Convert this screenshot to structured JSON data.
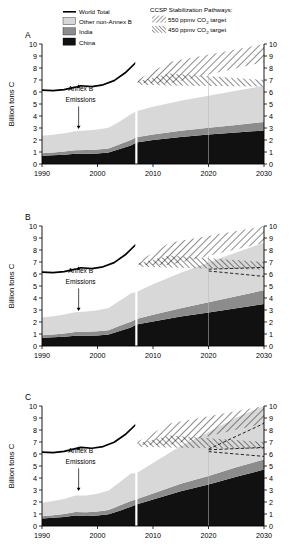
{
  "figure": {
    "width": 294,
    "height": 549,
    "background": "#ffffff"
  },
  "legend_series": {
    "title": "",
    "items": [
      {
        "label": "World Total",
        "swatch": "line",
        "color": "#000000",
        "name": "world-total"
      },
      {
        "label": "Other non-Annex B",
        "swatch": "fill",
        "color": "#d8d8d8",
        "name": "other-non-annex-b"
      },
      {
        "label": "India",
        "swatch": "fill",
        "color": "#8c8c8c",
        "name": "india"
      },
      {
        "label": "China",
        "swatch": "fill",
        "color": "#111111",
        "name": "china"
      }
    ]
  },
  "legend_pathways": {
    "title": "CCSP Stabilization Pathways:",
    "items": [
      {
        "label_pre": "550 ppmv CO",
        "label_sub": "2",
        "label_post": " target",
        "hatch": "forward",
        "name": "target-550"
      },
      {
        "label_pre": "450 ppmv CO",
        "label_sub": "2",
        "label_post": " target",
        "hatch": "backward",
        "name": "target-450"
      }
    ]
  },
  "annotation": {
    "line1": "Annex B",
    "line2": "Emissions"
  },
  "axis": {
    "ylabel": "Billion tons C",
    "yticks": [
      0,
      1,
      2,
      3,
      4,
      5,
      6,
      7,
      8,
      9,
      10
    ],
    "ylim": [
      0,
      10
    ],
    "xticks": [
      1990,
      2000,
      2010,
      2020,
      2030
    ],
    "xlim": [
      1990,
      2030
    ],
    "divider_year": 2007
  },
  "chart_data": {
    "type": "area",
    "title": "",
    "xlabel": "",
    "ylabel": "Billion tons C",
    "xlim": [
      1990,
      2030
    ],
    "ylim": [
      0,
      10
    ],
    "grid": false,
    "legend_position": "top",
    "panels": [
      {
        "label": "A",
        "x": [
          1990,
          1992,
          1994,
          1996,
          1998,
          2000,
          2002,
          2004,
          2006,
          2007,
          2010,
          2015,
          2020,
          2025,
          2030
        ],
        "series": [
          {
            "name": "China",
            "color": "#111111",
            "values": [
              0.68,
              0.72,
              0.78,
              0.86,
              0.86,
              0.88,
              0.95,
              1.25,
              1.55,
              1.8,
              2.0,
              2.25,
              2.45,
              2.62,
              2.8
            ]
          },
          {
            "name": "India",
            "color": "#8c8c8c",
            "values": [
              0.22,
              0.24,
              0.26,
              0.29,
              0.31,
              0.33,
              0.35,
              0.4,
              0.45,
              0.42,
              0.46,
              0.52,
              0.58,
              0.64,
              0.7
            ]
          },
          {
            "name": "Other non-Annex B",
            "color": "#d8d8d8",
            "values": [
              1.45,
              1.48,
              1.52,
              1.58,
              1.62,
              1.66,
              1.72,
              1.9,
              2.15,
              2.18,
              2.32,
              2.5,
              2.65,
              2.85,
              3.02
            ]
          }
        ],
        "world_total": {
          "x": [
            1990,
            1992,
            1994,
            1996,
            1997,
            1999,
            2001,
            2003,
            2005,
            2007
          ],
          "y": [
            6.15,
            6.12,
            6.2,
            6.4,
            6.52,
            6.45,
            6.6,
            6.95,
            7.6,
            8.5
          ]
        },
        "dashed_lines": [],
        "wedge_550": {
          "x": [
            2007,
            2013,
            2030
          ],
          "upper": [
            6.95,
            8.5,
            10.0
          ],
          "lower": [
            6.75,
            6.7,
            8.5
          ]
        },
        "wedge_450": {
          "x": [
            2007,
            2013,
            2030
          ],
          "upper": [
            6.85,
            7.55,
            7.0
          ],
          "lower": [
            6.6,
            6.55,
            6.45
          ]
        }
      },
      {
        "label": "B",
        "x": [
          1990,
          1992,
          1994,
          1996,
          1998,
          2000,
          2002,
          2004,
          2006,
          2007,
          2010,
          2015,
          2020,
          2025,
          2030
        ],
        "series": [
          {
            "name": "China",
            "color": "#111111",
            "values": [
              0.68,
              0.72,
              0.78,
              0.86,
              0.86,
              0.88,
              0.95,
              1.25,
              1.55,
              1.8,
              2.05,
              2.45,
              2.8,
              3.15,
              3.5
            ]
          },
          {
            "name": "India",
            "color": "#8c8c8c",
            "values": [
              0.22,
              0.24,
              0.26,
              0.3,
              0.32,
              0.34,
              0.37,
              0.43,
              0.48,
              0.45,
              0.55,
              0.7,
              0.85,
              1.0,
              1.15
            ]
          },
          {
            "name": "Other non-Annex B",
            "color": "#d8d8d8",
            "values": [
              1.48,
              1.52,
              1.58,
              1.66,
              1.7,
              1.76,
              1.85,
              2.1,
              2.35,
              2.25,
              2.55,
              2.95,
              3.3,
              3.65,
              3.95
            ]
          }
        ],
        "world_total": {
          "x": [
            1990,
            1992,
            1994,
            1996,
            1997,
            1999,
            2001,
            2003,
            2005,
            2007
          ],
          "y": [
            6.15,
            6.12,
            6.2,
            6.4,
            6.52,
            6.45,
            6.6,
            6.95,
            7.6,
            8.5
          ]
        },
        "dashed_lines": [
          {
            "x": [
              2020,
              2030
            ],
            "y": [
              6.4,
              6.55
            ]
          },
          {
            "x": [
              2020,
              2030
            ],
            "y": [
              6.25,
              5.8
            ]
          }
        ],
        "wedge_550": {
          "x": [
            2007,
            2013,
            2030
          ],
          "upper": [
            6.95,
            8.6,
            10.0
          ],
          "lower": [
            6.75,
            6.75,
            8.6
          ]
        },
        "wedge_450": {
          "x": [
            2007,
            2013,
            2030
          ],
          "upper": [
            6.85,
            7.55,
            7.0
          ],
          "lower": [
            6.6,
            6.55,
            6.35
          ]
        }
      },
      {
        "label": "C",
        "x": [
          1990,
          1992,
          1994,
          1996,
          1998,
          2000,
          2002,
          2004,
          2006,
          2007,
          2010,
          2015,
          2020,
          2025,
          2030
        ],
        "series": [
          {
            "name": "China",
            "color": "#111111",
            "values": [
              0.62,
              0.68,
              0.74,
              0.88,
              0.84,
              0.88,
              0.98,
              1.28,
              1.6,
              1.8,
              2.2,
              2.9,
              3.45,
              4.1,
              4.7
            ]
          },
          {
            "name": "India",
            "color": "#8c8c8c",
            "values": [
              0.2,
              0.22,
              0.25,
              0.28,
              0.3,
              0.32,
              0.36,
              0.42,
              0.48,
              0.42,
              0.5,
              0.62,
              0.72,
              0.8,
              0.85
            ]
          },
          {
            "name": "Other non-Annex B",
            "color": "#d8d8d8",
            "values": [
              1.12,
              1.18,
              1.25,
              1.38,
              1.4,
              1.48,
              1.62,
              1.95,
              2.3,
              2.18,
              2.55,
              3.15,
              3.65,
              4.15,
              4.45
            ]
          }
        ],
        "world_total": {
          "x": [
            1990,
            1992,
            1994,
            1996,
            1997,
            1999,
            2001,
            2003,
            2005,
            2007
          ],
          "y": [
            6.15,
            6.12,
            6.22,
            6.45,
            6.55,
            6.48,
            6.62,
            6.98,
            7.62,
            8.5
          ]
        },
        "dashed_lines": [
          {
            "x": [
              2020,
              2030
            ],
            "y": [
              6.4,
              8.55
            ]
          },
          {
            "x": [
              2020,
              2030
            ],
            "y": [
              6.35,
              6.55
            ]
          },
          {
            "x": [
              2020,
              2030
            ],
            "y": [
              6.2,
              5.8
            ]
          }
        ],
        "wedge_550": {
          "x": [
            2007,
            2013,
            2030
          ],
          "upper": [
            6.95,
            8.55,
            10.0
          ],
          "lower": [
            6.75,
            6.75,
            8.55
          ]
        },
        "wedge_450": {
          "x": [
            2007,
            2013,
            2030
          ],
          "upper": [
            6.85,
            7.55,
            7.0
          ],
          "lower": [
            6.6,
            6.55,
            6.4
          ]
        }
      }
    ]
  }
}
